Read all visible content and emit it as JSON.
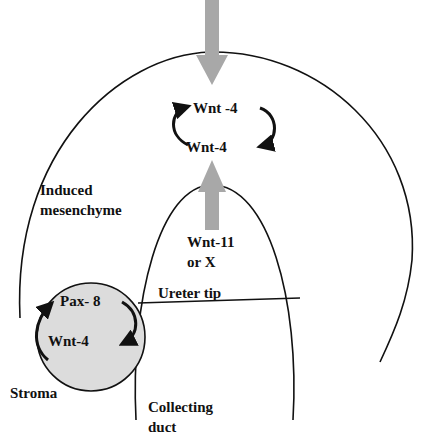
{
  "diagram": {
    "labels": {
      "top_wnt4_a": "Wnt -4",
      "top_wnt4_b": "Wnt-4",
      "induced_line1": "Induced",
      "induced_line2": "mesenchyme",
      "wnt11_line1": "Wnt-11",
      "wnt11_line2": "or X",
      "ureter_tip": "Ureter tip",
      "pax8": "Pax- 8",
      "circle_wnt4": "Wnt-4",
      "stroma": "Stroma",
      "collecting_line1": "Collecting",
      "collecting_line2": "duct"
    },
    "colors": {
      "line": "#111111",
      "arrow_gray": "#a8a8a8",
      "circle_fill": "#dcdcdc"
    }
  }
}
